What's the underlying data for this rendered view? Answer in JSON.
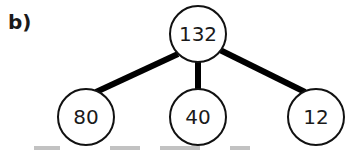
{
  "part_label": "b)",
  "tree": {
    "root": {
      "value": "132",
      "cx": 198,
      "cy": 34
    },
    "children": [
      {
        "value": "80",
        "cx": 86,
        "cy": 117
      },
      {
        "value": "40",
        "cx": 198,
        "cy": 117
      },
      {
        "value": "12",
        "cx": 316,
        "cy": 117
      }
    ]
  },
  "colors": {
    "stroke": "#111111",
    "edge": "#000000",
    "background": "#ffffff"
  }
}
